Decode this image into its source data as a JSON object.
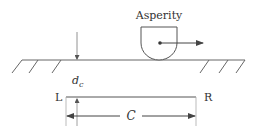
{
  "diagram": {
    "asperity_label": "Asperity",
    "depth_label_main": "d",
    "depth_label_sub": "c",
    "left_label": "L",
    "right_label": "R",
    "length_label": "C",
    "colors": {
      "stroke": "#555555",
      "text": "#333333",
      "background": "#ffffff"
    }
  }
}
